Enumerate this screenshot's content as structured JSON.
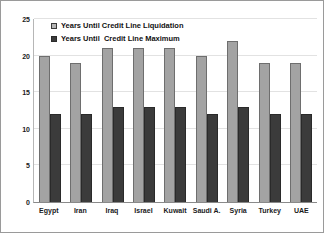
{
  "chart_data": {
    "type": "bar",
    "title": "",
    "subtitle": "",
    "xlabel": "",
    "ylabel": "",
    "ylim": [
      0,
      25
    ],
    "yticks": [
      0,
      5,
      10,
      15,
      20,
      25
    ],
    "ytick_labels": [
      "0",
      "5",
      "10",
      "15",
      "20",
      "25"
    ],
    "grid": true,
    "legend_position": "top-left-inside",
    "categories": [
      "Egypt",
      "Iran",
      "Iraq",
      "Israel",
      "Kuwait",
      "Saudi A.",
      "Syria",
      "Turkey",
      "UAE"
    ],
    "series": [
      {
        "name": "Years Until Credit Line Liquidation",
        "color": "#a3a3a3",
        "values": [
          20,
          19,
          21,
          21,
          21,
          20,
          22,
          19,
          19
        ]
      },
      {
        "name": "Years Until  Credit Line Maximum",
        "color": "#3b3b3b",
        "values": [
          12,
          12,
          13,
          13,
          13,
          12,
          13,
          12,
          12
        ]
      }
    ]
  },
  "legend": {
    "items": [
      {
        "label": "Years Until Credit Line Liquidation",
        "swatch": "light-gray-square"
      },
      {
        "label": "Years Until  Credit Line Maximum",
        "swatch": "dark-gray-square"
      }
    ]
  }
}
